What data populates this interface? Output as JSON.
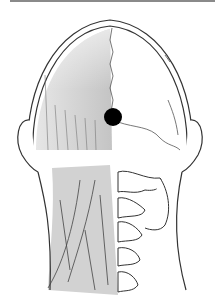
{
  "figure": {
    "marker": {
      "shape": "circle",
      "color": "#000000",
      "cx": 113,
      "cy": 117,
      "r": 9
    },
    "colors": {
      "line": "#333333",
      "shade": "#cfcfcf",
      "background": "#ffffff",
      "top_border": "#8a8a8a"
    }
  }
}
